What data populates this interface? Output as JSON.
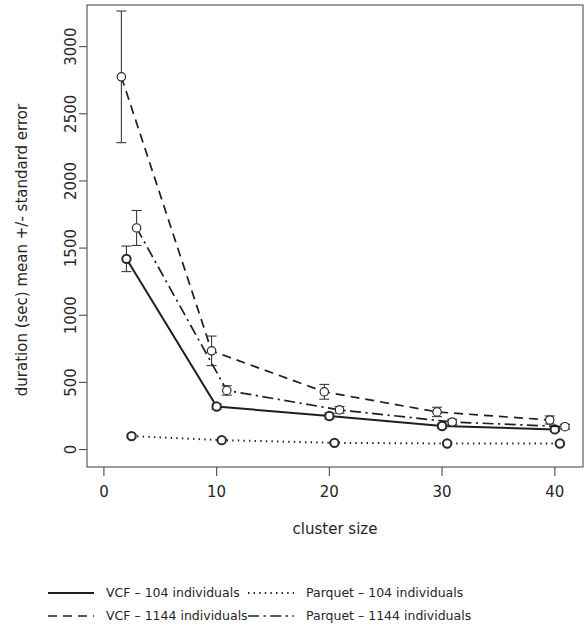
{
  "chart_data": {
    "type": "line",
    "title": "",
    "subtitle": "",
    "xlabel": "cluster size",
    "ylabel": "duration (sec) mean +/- standard error",
    "x": [
      2,
      10,
      20,
      30,
      40
    ],
    "xlim": [
      -1.5,
      42.5
    ],
    "ylim": [
      -130,
      3310
    ],
    "xticks": [
      0,
      10,
      20,
      30,
      40
    ],
    "xtick_labels": [
      "0",
      "10",
      "20",
      "30",
      "40"
    ],
    "yticks": [
      0,
      500,
      1000,
      1500,
      2000,
      2500,
      3000
    ],
    "ytick_labels": [
      "0",
      "500",
      "1000",
      "1500",
      "2000",
      "2500",
      "3000"
    ],
    "grid": false,
    "legend_position": "bottom",
    "error_bars": "mean +/- standard error",
    "marker": "open-circle",
    "series": [
      {
        "name": "VCF – 104 individuals",
        "linestyle": "solid",
        "values": [
          1420,
          320,
          250,
          175,
          150
        ],
        "errors": [
          95,
          20,
          22,
          18,
          15
        ]
      },
      {
        "name": "Parquet – 104 individuals",
        "linestyle": "dotted",
        "values": [
          100,
          70,
          50,
          45,
          45
        ],
        "errors": [
          12,
          8,
          6,
          6,
          6
        ]
      },
      {
        "name": "VCF – 1144 individuals",
        "linestyle": "dashed",
        "values": [
          2775,
          735,
          430,
          280,
          220
        ],
        "errors": [
          490,
          110,
          55,
          35,
          30
        ]
      },
      {
        "name": "Parquet – 1144 individuals",
        "linestyle": "dashdot",
        "values": [
          1650,
          440,
          295,
          205,
          170
        ],
        "errors": [
          130,
          35,
          25,
          20,
          18
        ]
      }
    ]
  },
  "legend": {
    "entries": [
      {
        "label": "VCF – 104 individuals",
        "linestyle": "solid"
      },
      {
        "label": "Parquet – 104 individuals",
        "linestyle": "dotted"
      },
      {
        "label": "VCF – 1144 individuals",
        "linestyle": "dashed"
      },
      {
        "label": "Parquet – 1144 individuals",
        "linestyle": "dashdot"
      }
    ]
  },
  "axes": {
    "x_title": "cluster size",
    "y_title": "duration (sec) mean +/- standard error"
  }
}
